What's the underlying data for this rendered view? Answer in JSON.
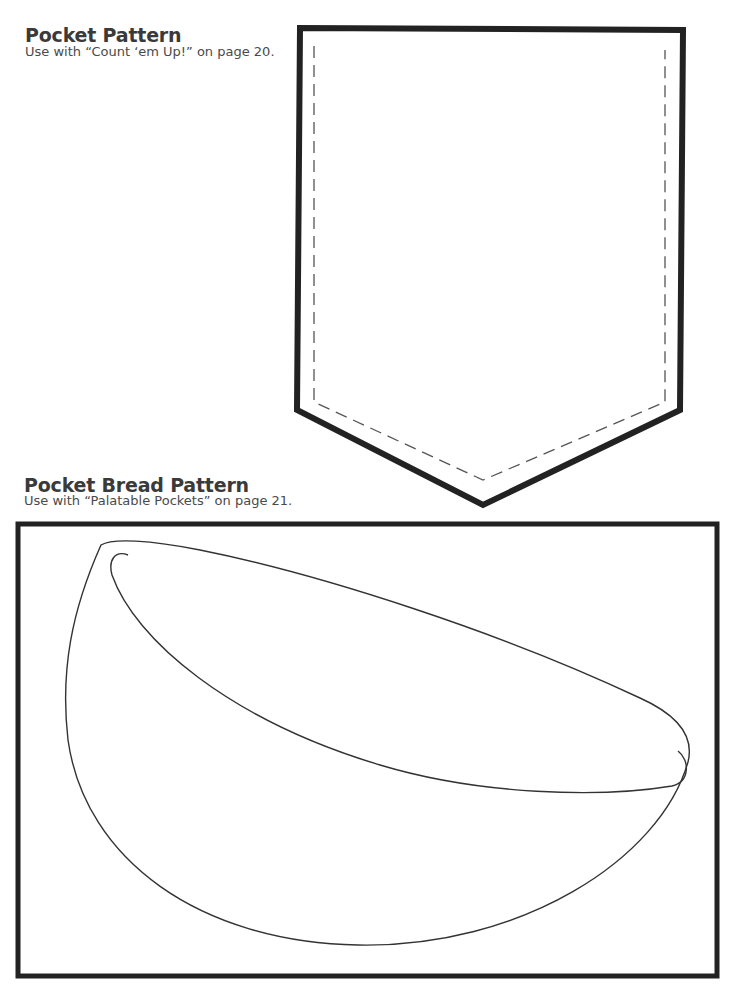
{
  "pocket_pattern": {
    "title": "Pocket Pattern",
    "subtitle": "Use with “Count ‘em Up!” on page 20."
  },
  "pocket_bread_pattern": {
    "title": "Pocket Bread Pattern",
    "subtitle": "Use with “Palatable Pockets” on page 21."
  },
  "colors": {
    "outline": "#222222",
    "dashed_line": "#555555",
    "bread_line": "#333333",
    "text": "#3a3a3a",
    "background": "#ffffff"
  }
}
